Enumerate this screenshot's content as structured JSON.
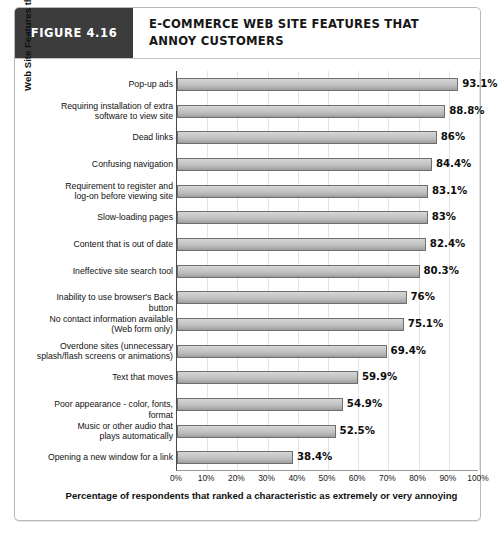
{
  "figure": {
    "tag_label": "FIGURE 4.16",
    "title": "E-COMMERCE WEB SITE FEATURES THAT ANNOY CUSTOMERS"
  },
  "colors": {
    "tag_background": "#3c3c3c",
    "bar_fill": "#c2c2c2",
    "bar_border": "#6f6f6f",
    "gridline": "#e3e3e3",
    "axis": "#4a4a4a",
    "card_border": "#b9b9b9"
  },
  "chart_data": {
    "type": "bar",
    "orientation": "horizontal",
    "title": "E-COMMERCE WEB SITE FEATURES THAT ANNOY CUSTOMERS",
    "xlabel": "Percentage of respondents that ranked a characteristic as extremely or very annoying",
    "ylabel": "Web Site Features that Annoy Customers",
    "xlim": [
      0,
      100
    ],
    "grid": true,
    "legend": "none",
    "xticks": [
      "0%",
      "10%",
      "20%",
      "30%",
      "40%",
      "50%",
      "60%",
      "70%",
      "80%",
      "90%",
      "100%"
    ],
    "xtick_values": [
      0,
      10,
      20,
      30,
      40,
      50,
      60,
      70,
      80,
      90,
      100
    ],
    "categories": [
      "Pop-up ads",
      "Requiring installation of extra software to view site",
      "Dead links",
      "Confusing navigation",
      "Requirement to register and log-on before viewing site",
      "Slow-loading pages",
      "Content that is out of date",
      "Ineffective site search tool",
      "Inability to use browser's Back button",
      "No contact information available (Web form only)",
      "Overdone sites (unnecessary splash/flash screens or animations)",
      "Text that moves",
      "Poor appearance - color, fonts, format",
      "Music or other audio that plays automatically",
      "Opening a new window for a link"
    ],
    "values": [
      93.1,
      88.8,
      86,
      84.4,
      83.1,
      83,
      82.4,
      80.3,
      76,
      75.1,
      69.4,
      59.9,
      54.9,
      52.5,
      38.4
    ],
    "value_labels": [
      "93.1%",
      "88.8%",
      "86%",
      "84.4%",
      "83.1%",
      "83%",
      "82.4%",
      "80.3%",
      "76%",
      "75.1%",
      "69.4%",
      "59.9%",
      "54.9%",
      "52.5%",
      "38.4%"
    ],
    "category_lines": [
      [
        "Pop-up ads"
      ],
      [
        "Requiring installation of extra",
        "software to view site"
      ],
      [
        "Dead links"
      ],
      [
        "Confusing navigation"
      ],
      [
        "Requirement to register and",
        "log-on before viewing site"
      ],
      [
        "Slow-loading pages"
      ],
      [
        "Content that is out of date"
      ],
      [
        "Ineffective site search tool"
      ],
      [
        "Inability to use browser's Back button"
      ],
      [
        "No contact information available",
        "(Web form only)"
      ],
      [
        "Overdone sites (unnecessary",
        "splash/flash screens or animations)"
      ],
      [
        "Text that moves"
      ],
      [
        "Poor appearance - color, fonts, format"
      ],
      [
        "Music or other audio that",
        "plays automatically"
      ],
      [
        "Opening a new window for a link"
      ]
    ]
  }
}
